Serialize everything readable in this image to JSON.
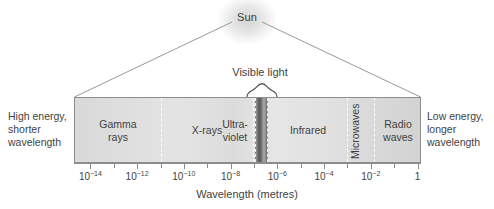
{
  "figure": {
    "source_label": "Sun",
    "axis_title": "Wavelength (metres)",
    "visible_light_label": "Visible light",
    "left_note": "High energy,\nshorter\nwavelength",
    "right_note": "Low energy,\nlonger\nwavelength"
  },
  "colors": {
    "frame": "#8d8d8d",
    "text": "#3f3f3f",
    "bar_light": "#e4e4e4",
    "bar_dark": "#d3d3d3",
    "divider": "#fbfbfb",
    "visible_band": "#565656",
    "background": "#ffffff"
  },
  "chart_data": {
    "type": "bar",
    "xlabel": "Wavelength (metres)",
    "ylabel": "",
    "scale": "log10",
    "xlim": [
      -14.7,
      0.15
    ],
    "grid": false,
    "legend": "none",
    "tick_labels": [
      "10-14",
      "10-12",
      "10-10",
      "10-8",
      "10-6",
      "10-4",
      "10-2",
      "1"
    ],
    "tick_exponents": [
      -14,
      -12,
      -10,
      -8,
      -6,
      -4,
      -2,
      0
    ],
    "tick_mantissa": [
      "10",
      "10",
      "10",
      "10",
      "10",
      "10",
      "10",
      "1"
    ],
    "minor_tick_exponents": [
      -13,
      -11,
      -9,
      -7,
      -5,
      -3,
      -1
    ],
    "categories": [
      "Gamma rays",
      "X-rays",
      "Ultra-violet",
      "Visible light",
      "Infrared",
      "Microwaves",
      "Radio waves"
    ],
    "bands": [
      {
        "name": "Gamma rays",
        "label": "Gamma\nrays",
        "start_exponent": -14.7,
        "end_exponent": -12.0,
        "rotated": false,
        "highlight": false
      },
      {
        "name": "X-rays",
        "label": "X-rays",
        "start_exponent": -12.0,
        "end_exponent": -8.1,
        "rotated": false,
        "highlight": false
      },
      {
        "name": "Ultra-violet",
        "label": "Ultra-\nviolet",
        "start_exponent": -8.1,
        "end_exponent": -6.85,
        "rotated": false,
        "highlight": false
      },
      {
        "name": "Visible light",
        "label": "",
        "start_exponent": -6.85,
        "end_exponent": -6.3,
        "rotated": false,
        "highlight": true
      },
      {
        "name": "Infrared",
        "label": "Infrared",
        "start_exponent": -6.3,
        "end_exponent": -3.1,
        "rotated": false,
        "highlight": false
      },
      {
        "name": "Microwaves",
        "label": "Microwaves",
        "start_exponent": -3.1,
        "end_exponent": -2.0,
        "rotated": true,
        "highlight": false
      },
      {
        "name": "Radio waves",
        "label": "Radio\nwaves",
        "start_exponent": -2.0,
        "end_exponent": 0.15,
        "rotated": false,
        "highlight": false
      }
    ]
  }
}
